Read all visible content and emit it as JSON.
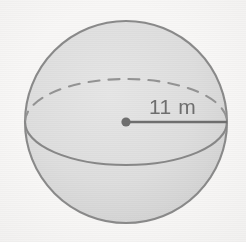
{
  "figure": {
    "kind": "sphere-with-radius",
    "caption_text": "11 m",
    "measure_value": "11",
    "measure_unit": "m",
    "colors": {
      "background": "#f8f7f6",
      "sphere_fill": "#dedede",
      "outline_stroke": "#8a8a8a",
      "equator_stroke": "#888888",
      "hidden_edge_stroke": "#949494",
      "radius_line_stroke": "#6f6f6f",
      "center_dot_fill": "#6f6f6f",
      "label_text": "#6f6f6f"
    },
    "geometry": {
      "center_x": 126,
      "center_y": 122,
      "radius_px": 101,
      "equator_ry": 43,
      "radius_line_x2": 227,
      "center_dot_r": 4.5,
      "label_x": 149,
      "label_y": 114
    }
  }
}
